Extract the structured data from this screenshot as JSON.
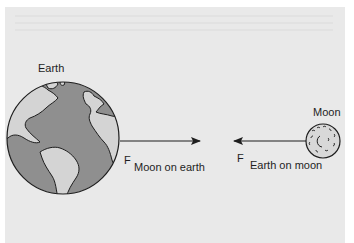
{
  "figure": {
    "earth": {
      "label": "Earth",
      "ocean_color": "#8f8f8f",
      "land_color": "#d4d4d4"
    },
    "moon": {
      "label": "Moon",
      "fill_color": "#d8d8d8"
    },
    "forces": [
      {
        "symbol": "F",
        "subscript": "Moon on earth",
        "direction": "right"
      },
      {
        "symbol": "F",
        "subscript": "Earth on moon",
        "direction": "left"
      }
    ],
    "colors": {
      "background": "#e9e9e9",
      "outline": "#1e1e1e"
    }
  }
}
